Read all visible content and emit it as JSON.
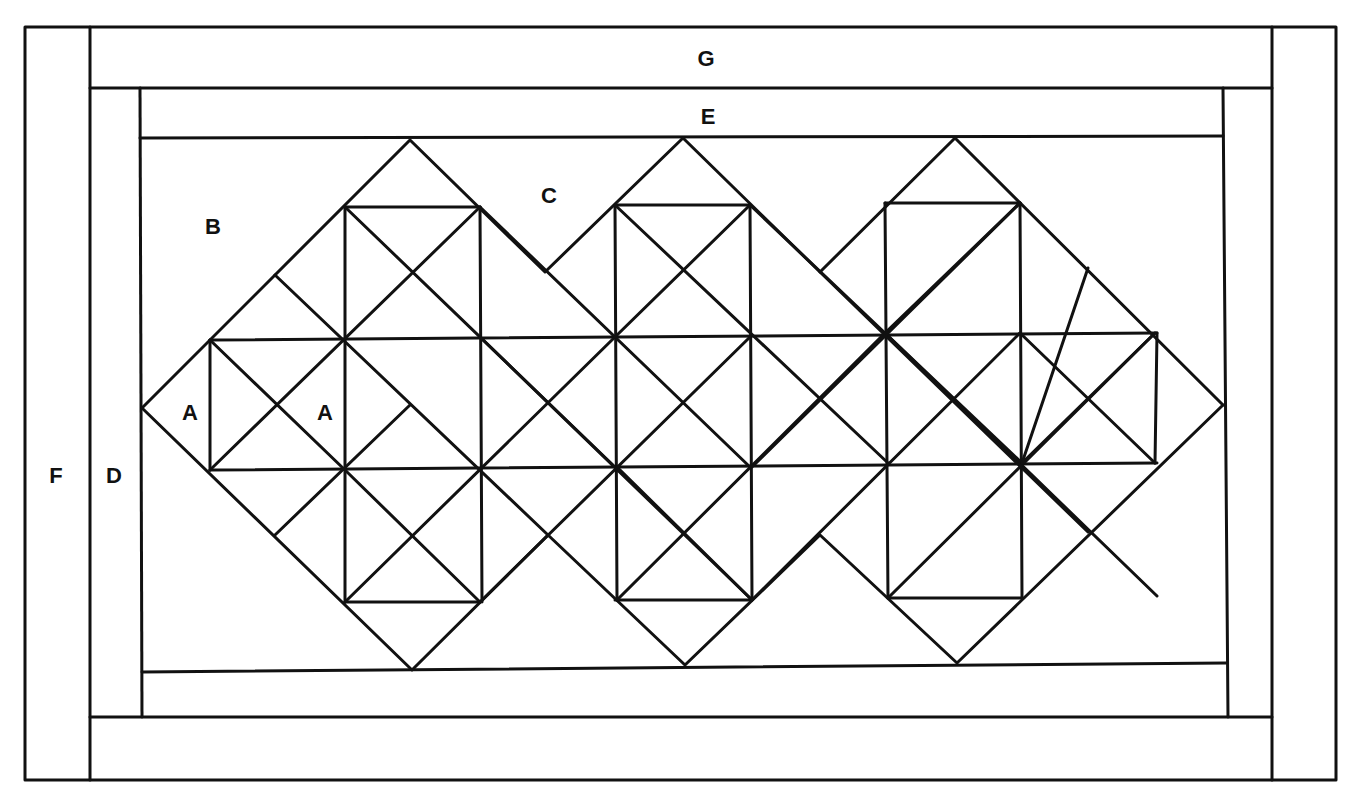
{
  "diagram": {
    "type": "quilt-block-layout",
    "colors": {
      "line": "#111111",
      "background": "#ffffff"
    },
    "labels": {
      "G": "G",
      "E": "E",
      "F": "F",
      "D": "D",
      "B": "B",
      "C": "C",
      "A1": "A",
      "A2": "A"
    },
    "pieces": [
      {
        "id": "F",
        "role": "outer side border strips"
      },
      {
        "id": "G",
        "role": "outer top/bottom border strips"
      },
      {
        "id": "D",
        "role": "inner side border strips"
      },
      {
        "id": "E",
        "role": "inner top/bottom border strips"
      },
      {
        "id": "B",
        "role": "corner setting triangle"
      },
      {
        "id": "C",
        "role": "side setting triangle"
      },
      {
        "id": "A",
        "role": "small pieced triangles"
      }
    ],
    "diamond_count": 3
  }
}
